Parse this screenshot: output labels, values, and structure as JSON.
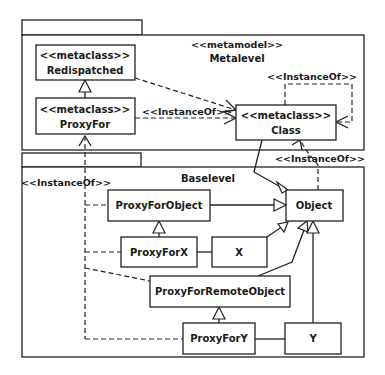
{
  "packages": {
    "metalevel": {
      "stereotype": "<<metamodel>>",
      "name": "Metalevel"
    },
    "baselevel": {
      "name": "Baselevel"
    }
  },
  "classes": {
    "redispatched": {
      "stereotype": "<<metaclass>>",
      "name": "Redispatched"
    },
    "proxyFor": {
      "stereotype": "<<metaclass>>",
      "name": "ProxyFor"
    },
    "class": {
      "stereotype": "<<metaclass>>",
      "name": "Class"
    },
    "proxyForObject": {
      "name": "ProxyForObject"
    },
    "object": {
      "name": "Object"
    },
    "proxyForX": {
      "name": "ProxyForX"
    },
    "x": {
      "name": "X"
    },
    "proxyForRemoteObject": {
      "name": "ProxyForRemoteObject"
    },
    "proxyForY": {
      "name": "ProxyForY"
    },
    "y": {
      "name": "Y"
    }
  },
  "relations": {
    "instanceOfLabel": "<<InstanceOf>>",
    "labels": {
      "proxyForToClass": "<<InstanceOf>>",
      "classSelf": "<<InstanceOf>>",
      "objectToClass": "<<InstanceOf>>",
      "baseToProxyFor": "<<InstanceOf>>"
    }
  }
}
